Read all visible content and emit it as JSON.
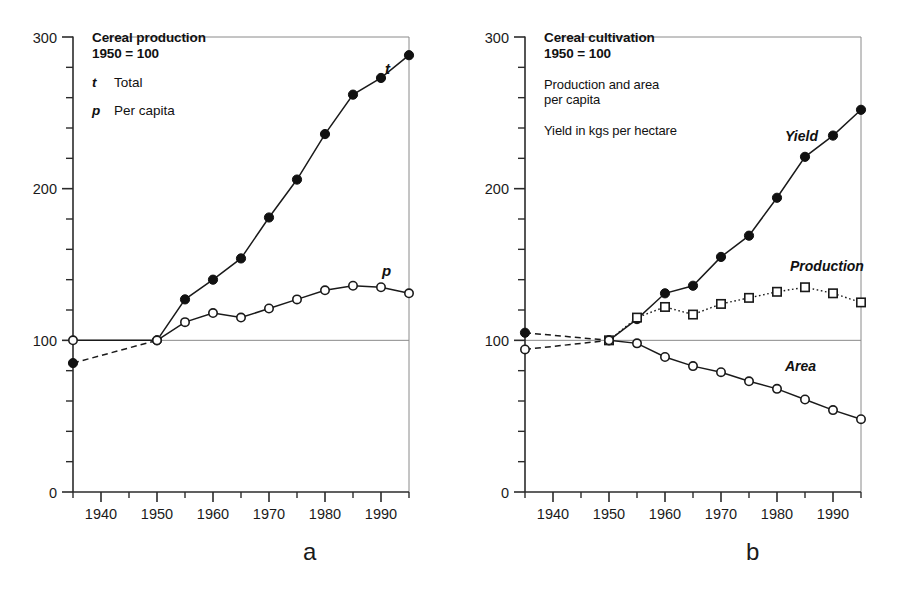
{
  "figure": {
    "panels": [
      {
        "letter": "a",
        "title_line1": "Cereal production",
        "title_line2": "1950 = 100",
        "legend_items": [
          {
            "key": "t",
            "label": "Total"
          },
          {
            "key": "p",
            "label": "Per capita"
          }
        ],
        "notes": []
      },
      {
        "letter": "b",
        "title_line1": "Cereal cultivation",
        "title_line2": "1950 = 100",
        "legend_items": [],
        "notes": [
          "Production and area",
          "per capita",
          "Yield in kgs per hectare"
        ]
      }
    ]
  },
  "chart_data": [
    {
      "id": "panel-a",
      "type": "line",
      "title": "Cereal production",
      "subtitle": "1950 = 100",
      "xlabel": "",
      "ylabel": "",
      "xlim": [
        1935,
        1995
      ],
      "ylim": [
        0,
        300
      ],
      "xticks": [
        1940,
        1950,
        1960,
        1970,
        1980,
        1990
      ],
      "xtick_labels": [
        "1940",
        "1950",
        "1960",
        "1970",
        "1980",
        "1990"
      ],
      "minor_xtick_step": 5,
      "yticks": [
        0,
        100,
        200,
        300
      ],
      "ytick_labels": [
        "0",
        "100",
        "200",
        "300"
      ],
      "minor_ytick_step": 20,
      "grid": false,
      "reference_line_y": 100,
      "legend_position": "top-left",
      "x": [
        1935,
        1950,
        1955,
        1960,
        1965,
        1970,
        1975,
        1980,
        1985,
        1990,
        1995
      ],
      "series": [
        {
          "name": "t",
          "label": "Total",
          "marker": "filled-circle",
          "linestyle": "solid",
          "leading_segment_style": "dashed",
          "values": [
            85,
            100,
            127,
            140,
            154,
            181,
            206,
            236,
            262,
            273,
            288
          ],
          "annotation": "t"
        },
        {
          "name": "p",
          "label": "Per capita",
          "marker": "open-circle",
          "linestyle": "solid",
          "leading_segment_style": "solid",
          "values": [
            100,
            100,
            112,
            118,
            115,
            121,
            127,
            133,
            136,
            135,
            131,
            125
          ],
          "annotation": "p"
        }
      ]
    },
    {
      "id": "panel-b",
      "type": "line",
      "title": "Cereal cultivation",
      "subtitle": "1950 = 100",
      "notes": [
        "Production and area per capita",
        "Yield in kgs per hectare"
      ],
      "xlabel": "",
      "ylabel": "",
      "xlim": [
        1935,
        1995
      ],
      "ylim": [
        0,
        300
      ],
      "xticks": [
        1940,
        1950,
        1960,
        1970,
        1980,
        1990
      ],
      "xtick_labels": [
        "1940",
        "1950",
        "1960",
        "1970",
        "1980",
        "1990"
      ],
      "minor_xtick_step": 5,
      "yticks": [
        0,
        100,
        200,
        300
      ],
      "ytick_labels": [
        "0",
        "100",
        "200",
        "300"
      ],
      "minor_ytick_step": 20,
      "grid": false,
      "reference_line_y": 100,
      "legend_position": "top-left",
      "x": [
        1935,
        1950,
        1955,
        1960,
        1965,
        1970,
        1975,
        1980,
        1985,
        1990,
        1995
      ],
      "series": [
        {
          "name": "Yield",
          "label": "Yield",
          "marker": "filled-circle",
          "linestyle": "solid",
          "leading_segment_style": "dashed",
          "values": [
            105,
            100,
            114,
            131,
            136,
            155,
            169,
            194,
            221,
            235,
            252
          ],
          "annotation": "Yield"
        },
        {
          "name": "Production",
          "label": "Production",
          "marker": "open-square",
          "linestyle": "dotted",
          "leading_segment_style": "none",
          "values": [
            null,
            100,
            115,
            122,
            117,
            124,
            128,
            132,
            135,
            131,
            125
          ],
          "annotation": "Production"
        },
        {
          "name": "Area",
          "label": "Area",
          "marker": "open-circle",
          "linestyle": "solid",
          "leading_segment_style": "dashed",
          "values": [
            94,
            100,
            98,
            89,
            83,
            79,
            73,
            68,
            61,
            54,
            48
          ],
          "annotation": "Area"
        }
      ]
    }
  ],
  "colors": {
    "ink": "#1a1a1a",
    "axis": "#2b2b2b",
    "reference": "#8a8a8a",
    "marker_fill": "#111111",
    "marker_open": "#ffffff",
    "background": "#ffffff"
  }
}
